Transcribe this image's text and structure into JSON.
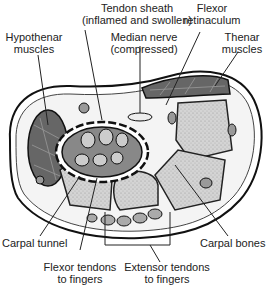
{
  "labels": {
    "tendon_sheath": {
      "line1": "Tendon sheath",
      "line2": "(inflamed and swollen)"
    },
    "flexor_retinaculum": {
      "line1": "Flexor",
      "line2": "retinaculum"
    },
    "hypothenar": {
      "line1": "Hypothenar",
      "line2": "muscles"
    },
    "median_nerve": {
      "line1": "Median nerve",
      "line2": "(compressed)"
    },
    "thenar": {
      "line1": "Thenar",
      "line2": "muscles"
    },
    "carpal_tunnel": {
      "line1": "Carpal tunnel"
    },
    "carpal_bones": {
      "line1": "Carpal bones"
    },
    "flexor_tendons": {
      "line1": "Flexor tendons",
      "line2": "to fingers"
    },
    "extensor_tendons": {
      "line1": "Extensor tendons",
      "line2": "to fingers"
    }
  }
}
